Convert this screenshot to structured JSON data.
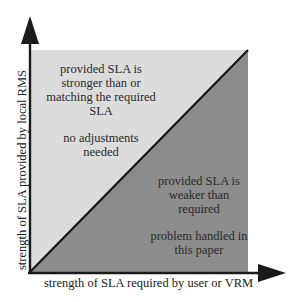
{
  "diagram": {
    "type": "quadrant-comparison",
    "x_axis": {
      "label": "strength of SLA required by user or VRM"
    },
    "y_axis": {
      "label": "strength of SLA provided by local RMS"
    },
    "regions": [
      {
        "id": "upper-left",
        "lines": [
          "provided SLA is",
          "stronger than or",
          "matching the required",
          "SLA"
        ],
        "note": [
          "no adjustments",
          "needed"
        ],
        "color": "#dcdcdc"
      },
      {
        "id": "lower-right",
        "lines": [
          "provided SLA is",
          "weaker than",
          "required"
        ],
        "note": [
          "problem handled in",
          "this paper"
        ],
        "color": "#8c8c8c"
      }
    ],
    "colors": {
      "axis": "#1a1a1a",
      "diagonal": "#151515",
      "background": "#ffffff"
    }
  }
}
